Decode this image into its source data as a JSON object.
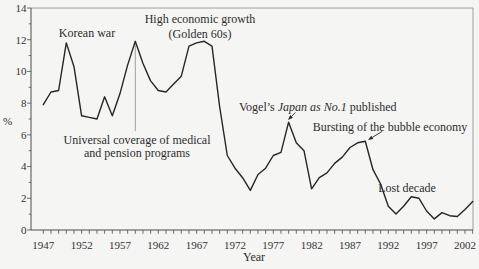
{
  "figure": {
    "colors": {
      "background": "#f5f5f3",
      "line": "#262626",
      "axis": "#4d4d4d",
      "border": "#9e9e9e",
      "text": "#333333",
      "event_line": "#8a8a8a",
      "annotation_text": "#2d2d2d"
    }
  },
  "chart_data": {
    "type": "line",
    "title": "",
    "xlabel": "Year",
    "ylabel": "%",
    "x_range": [
      1947,
      2003
    ],
    "ylim": [
      0,
      14
    ],
    "x_tick_labels": [
      1947,
      1952,
      1957,
      1962,
      1967,
      1972,
      1977,
      1982,
      1987,
      1992,
      1997,
      2002
    ],
    "y_tick_labels": [
      0,
      2,
      4,
      6,
      8,
      10,
      12,
      14
    ],
    "grid": false,
    "legend": "none",
    "series": [
      {
        "x": [
          1947,
          1948,
          1949,
          1950,
          1951,
          1952,
          1953,
          1954,
          1955,
          1956,
          1957,
          1958,
          1959,
          1960,
          1961,
          1962,
          1963,
          1964,
          1965,
          1966,
          1967,
          1968,
          1969,
          1970,
          1971,
          1972,
          1973,
          1974,
          1975,
          1976,
          1977,
          1978,
          1979,
          1980,
          1981,
          1982,
          1983,
          1984,
          1985,
          1986,
          1987,
          1988,
          1989,
          1990,
          1991,
          1992,
          1993,
          1994,
          1995,
          1996,
          1997,
          1998,
          1999,
          2000,
          2001,
          2002,
          2003
        ],
        "values": [
          7.9,
          8.7,
          8.8,
          11.8,
          10.3,
          7.2,
          7.1,
          7.0,
          8.4,
          7.2,
          8.6,
          10.4,
          11.9,
          10.5,
          9.4,
          8.8,
          8.7,
          9.2,
          9.7,
          11.6,
          11.8,
          11.9,
          11.6,
          7.8,
          4.7,
          3.9,
          3.3,
          2.5,
          3.5,
          3.9,
          4.7,
          4.9,
          6.8,
          5.5,
          5.0,
          2.6,
          3.3,
          3.6,
          4.2,
          4.6,
          5.2,
          5.5,
          5.6,
          3.8,
          2.9,
          1.5,
          1.0,
          1.5,
          2.1,
          2.0,
          1.2,
          0.7,
          1.1,
          0.9,
          0.85,
          1.3,
          1.8
        ]
      }
    ],
    "vline": {
      "x_year": 1959,
      "from_value": 11.9,
      "to_px_y": 131
    },
    "arrows": [
      {
        "name": "vogel-arrow",
        "from_px": [
          295.5,
          112.5
        ],
        "to_px": [
          288,
          120
        ]
      },
      {
        "name": "bubble-arrow",
        "from_px": [
          382,
          131.5
        ],
        "to_px": [
          368,
          140
        ]
      }
    ],
    "annotations": {
      "korean_war": {
        "text": "Korean war"
      },
      "golden_60s": {
        "line1": "High economic growth",
        "line2": "(Golden 60s)"
      },
      "universal": {
        "line1": "Universal coverage of medical",
        "line2": "and pension programs"
      },
      "vogel": {
        "pre": "Vogel’s ",
        "italic": "Japan as No.1",
        "post": " published"
      },
      "bubble": {
        "text": "Bursting of the bubble economy"
      },
      "lost_decade": {
        "text": "Lost decade"
      }
    }
  }
}
